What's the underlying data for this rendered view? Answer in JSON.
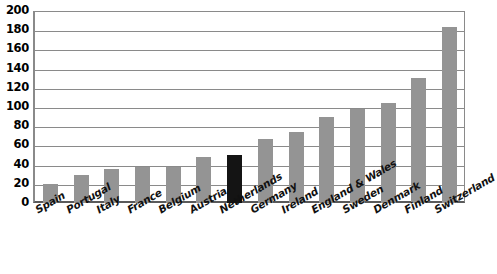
{
  "chart_data": {
    "type": "bar",
    "title": "",
    "xlabel": "",
    "ylabel": "",
    "ylim": [
      0,
      200
    ],
    "ytick_step": 20,
    "yticks": [
      "200",
      "180",
      "160",
      "140",
      "120",
      "100",
      "80",
      "60",
      "40",
      "20",
      "0"
    ],
    "grid": true,
    "legend": "none",
    "categories": [
      "Spain",
      "Portugal",
      "Italy",
      "France",
      "Belgium",
      "Austria",
      "Netherlands",
      "Germany",
      "Ireland",
      "England & Wales",
      "Sweden",
      "Denmark",
      "Finland",
      "Switzerland"
    ],
    "values": [
      20,
      29,
      35,
      37,
      38,
      48,
      50,
      67,
      74,
      90,
      98,
      104,
      130,
      183
    ],
    "highlight_category": "Netherlands",
    "colors": {
      "bar": "#949494",
      "highlight_bar": "#141414",
      "gridline": "#8a8a8a",
      "axis": "#5a5a5a",
      "background": "#ffffff",
      "text": "#111111"
    }
  }
}
